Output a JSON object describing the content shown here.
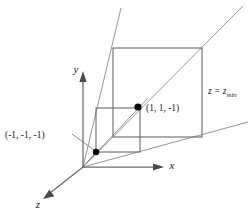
{
  "figure": {
    "background_color": "#ffffff",
    "line_color": "#6b6b6b",
    "ray_color": "#8a8a8a",
    "dot_color": "#000000",
    "text_color": "#1a1a1a"
  },
  "axes": [
    {
      "id": "y-axis",
      "label": "y",
      "direction": "up",
      "origin": {
        "x": 83,
        "y": 167
      },
      "tip": {
        "x": 83,
        "y": 73
      }
    },
    {
      "id": "x-axis",
      "label": "x",
      "direction": "right",
      "origin": {
        "x": 83,
        "y": 167
      },
      "tip": {
        "x": 162,
        "y": 167
      }
    },
    {
      "id": "z-axis",
      "label": "z",
      "direction": "down-left",
      "origin": {
        "x": 83,
        "y": 167
      },
      "tip": {
        "x": 43,
        "y": 199
      }
    }
  ],
  "labels": {
    "origin_point": "(-1, -1, -1)",
    "far_point": "(1, 1, -1)",
    "plane_label_main": "z = z",
    "plane_label_sub": "min",
    "axis_x": "x",
    "axis_y": "y",
    "axis_z": "z"
  },
  "points": [
    {
      "name": "near-corner-point",
      "label": "(-1, -1, -1)",
      "x": 96,
      "y": 152
    },
    {
      "name": "far-corner-point",
      "label": "(1, 1, -1)",
      "x": 138,
      "y": 107
    }
  ],
  "near_rectangle": {
    "name": "near-clip-rectangle",
    "top_left": {
      "x": 96,
      "y": 108
    },
    "bottom_right": {
      "x": 140,
      "y": 152
    },
    "width": 44,
    "height": 44
  },
  "far_rectangle": {
    "name": "far-clip-rectangle",
    "top_left": {
      "x": 113,
      "y": 48
    },
    "bottom_right": {
      "x": 202,
      "y": 137
    },
    "width": 89,
    "height": 89
  },
  "rays": [
    {
      "name": "ray-upper-left",
      "from": {
        "x": 83,
        "y": 167
      },
      "to": {
        "x": 121,
        "y": 8
      }
    },
    {
      "name": "ray-upper-right",
      "from": {
        "x": 83,
        "y": 167
      },
      "to": {
        "x": 243,
        "y": 6
      }
    },
    {
      "name": "ray-lower-right",
      "from": {
        "x": 83,
        "y": 167
      },
      "to": {
        "x": 248,
        "y": 122
      }
    },
    {
      "name": "ray-diagonal-through-points",
      "from": {
        "x": 83,
        "y": 167
      },
      "to": {
        "x": 148,
        "y": 98
      }
    }
  ],
  "leader": {
    "name": "label-leader-line",
    "from": {
      "x": 72,
      "y": 134
    },
    "to": {
      "x": 94,
      "y": 150
    }
  }
}
